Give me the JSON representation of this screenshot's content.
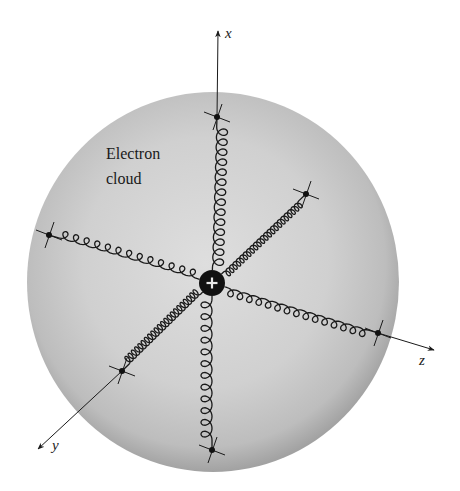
{
  "diagram": {
    "type": "physical-model",
    "labels": {
      "cloud_line1": "Electron",
      "cloud_line2": "cloud",
      "nucleus_sign": "+",
      "axis_x": "x",
      "axis_y": "y",
      "axis_z": "z"
    },
    "colors": {
      "sphere_center": "#dcdcdc",
      "sphere_edge": "#a4a4a4",
      "ink": "#1a1a1a",
      "nucleus": "#111111",
      "nucleus_sign": "#e8e8e8"
    },
    "geometry": {
      "sphere": {
        "cx": 213,
        "cy": 282,
        "rx": 186,
        "ry": 190
      },
      "nucleus": {
        "cx": 212,
        "cy": 283,
        "r": 13
      },
      "anchors": [
        {
          "name": "x-positive",
          "x": 217,
          "y": 117
        },
        {
          "name": "x-negative",
          "x": 212,
          "y": 450
        },
        {
          "name": "z-negative",
          "x": 49,
          "y": 235
        },
        {
          "name": "z-positive",
          "x": 378,
          "y": 333
        },
        {
          "name": "y-positive",
          "x": 122,
          "y": 371
        },
        {
          "name": "y-negative",
          "x": 306,
          "y": 194
        }
      ],
      "axes": [
        {
          "name": "x",
          "from": [
            217,
            117
          ],
          "to": [
            218,
            30
          ]
        },
        {
          "name": "z",
          "from": [
            378,
            333
          ],
          "to": [
            435,
            350
          ]
        },
        {
          "name": "y",
          "from": [
            122,
            371
          ],
          "to": [
            37,
            450
          ]
        }
      ]
    }
  }
}
